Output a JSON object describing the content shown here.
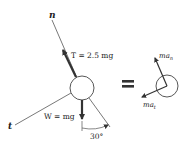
{
  "diagram": {
    "type": "free-body diagram and kinetic diagram",
    "fbd": {
      "axis_n_label": "n",
      "axis_t_label": "t",
      "tension_label": "T = 2.5 mg",
      "weight_label": "W = mg",
      "angle_label": "30°"
    },
    "equals_sign": "=",
    "kd": {
      "normal_label": "ma_n",
      "normal_base": "ma",
      "normal_sub": "n",
      "tangential_label": "ma_t",
      "tangential_base": "ma",
      "tangential_sub": "t"
    },
    "colors": {
      "force_arrow": "#3a3a3a",
      "line": "#555555",
      "text": "#222222"
    }
  }
}
